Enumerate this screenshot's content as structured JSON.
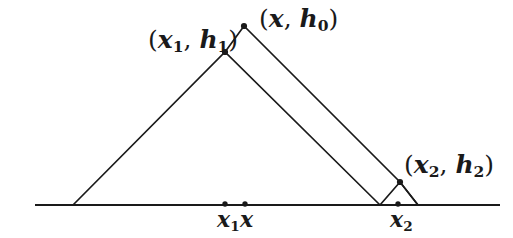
{
  "figure": {
    "background_color": "#ffffff",
    "stroke_color": "#1a1a1a",
    "canvas": {
      "width": 513,
      "height": 238
    },
    "labels": {
      "peak_left": {
        "text": "(x₁, h₁)",
        "open": "(",
        "var1": "x",
        "sub1": "1",
        "comma": ", ",
        "var2": "h",
        "sub2": "1",
        "close": ")"
      },
      "peak_top": {
        "text": "(x, h₀)",
        "open": "(",
        "var1": "x",
        "sub1": "",
        "comma": ", ",
        "var2": "h",
        "sub2": "0",
        "close": ")"
      },
      "peak_right": {
        "text": "(x₂, h₂)",
        "open": "(",
        "var1": "x",
        "sub1": "2",
        "comma": ", ",
        "var2": "h",
        "sub2": "2",
        "close": ")"
      },
      "axis_x1": {
        "var": "x",
        "sub": "1"
      },
      "axis_x": {
        "var": "x",
        "sub": ""
      },
      "axis_x2": {
        "var": "x",
        "sub": "2"
      }
    }
  },
  "chart_data": {
    "type": "line",
    "title": "",
    "xlabel": "",
    "ylabel": "",
    "grid": false,
    "legend": null,
    "axis": {
      "name": "baseline",
      "y": 205,
      "x_start": 35,
      "x_end": 500
    },
    "vertices": {
      "left_foot": {
        "x": 73,
        "y": 205
      },
      "x1_h1": {
        "x": 225,
        "y": 52
      },
      "x_h0": {
        "x": 244,
        "y": 26
      },
      "mid_foot": {
        "x": 380,
        "y": 205
      },
      "x2_h2": {
        "x": 400,
        "y": 182
      },
      "right_foot": {
        "x": 418,
        "y": 205
      }
    },
    "series": [
      {
        "name": "tent-1",
        "points": [
          [
            73,
            205
          ],
          [
            225,
            52
          ],
          [
            380,
            205
          ]
        ]
      },
      {
        "name": "tent-0",
        "points": [
          [
            225,
            52
          ],
          [
            244,
            26
          ],
          [
            400,
            182
          ],
          [
            418,
            205
          ]
        ]
      },
      {
        "name": "tent-2",
        "points": [
          [
            380,
            205
          ],
          [
            400,
            182
          ],
          [
            418,
            205
          ]
        ]
      }
    ],
    "marked_points": [
      {
        "name": "x1-h1-dot",
        "x": 225,
        "y": 52
      },
      {
        "name": "x-h0-dot",
        "x": 244,
        "y": 26
      },
      {
        "name": "x2-h2-dot",
        "x": 400,
        "y": 182
      },
      {
        "name": "axis-x1-dot",
        "x": 225,
        "y": 205
      },
      {
        "name": "axis-x-dot",
        "x": 245,
        "y": 205
      },
      {
        "name": "axis-x2-dot",
        "x": 398,
        "y": 205
      }
    ]
  }
}
